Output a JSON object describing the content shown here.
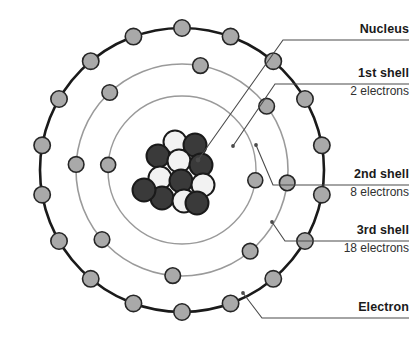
{
  "figure": {
    "background_color": "#ffffff"
  },
  "colors": {
    "outer_shell_stroke": "#1a1a1a",
    "inner_shell_stroke": "#9a9a9a",
    "electron_fill": "#a9a9a9",
    "electron_stroke": "#262626",
    "proton_fill": "#3a3a3a",
    "neutron_fill": "#f2f2f2",
    "nucleon_stroke": "#1a1a1a",
    "leader_line": "#4a4a4a",
    "label_text": "#1a1a1a",
    "sublabel_text": "#303030"
  },
  "labels": [
    {
      "id": "nucleus",
      "title": "Nucleus",
      "sub": "",
      "x": 318,
      "y": 22,
      "rule_y": 40,
      "rule_x1": 300,
      "rule_x2": 409
    },
    {
      "id": "shell-1",
      "title": "1st shell",
      "sub": "2 electrons",
      "x": 318,
      "y": 66,
      "rule_y": 84,
      "rule_x1": 292,
      "rule_x2": 409
    },
    {
      "id": "shell-2",
      "title": "2nd shell",
      "sub": "8 electrons",
      "x": 318,
      "y": 167,
      "rule_y": 185,
      "rule_x1": 292,
      "rule_x2": 409
    },
    {
      "id": "shell-3",
      "title": "3rd shell",
      "sub": "18 electrons",
      "x": 318,
      "y": 223,
      "rule_y": 241,
      "rule_x1": 300,
      "rule_x2": 409
    },
    {
      "id": "electron",
      "title": "Electron",
      "sub": "",
      "x": 318,
      "y": 300,
      "rule_y": 318,
      "rule_x1": 285,
      "rule_x2": 409
    }
  ],
  "leaders": [
    {
      "id": "leader-nucleus",
      "points": "300,40 283,40 198,160",
      "arrow_to": [
        198,
        160
      ],
      "has_arrow": true
    },
    {
      "id": "leader-shell-1",
      "points": "292,84 275,84 233,146",
      "arrow_to": [
        233,
        146
      ],
      "has_arrow": false
    },
    {
      "id": "leader-shell-2",
      "points": "292,185 273,185 256,145",
      "arrow_to": [
        256,
        145
      ],
      "has_arrow": false
    },
    {
      "id": "leader-shell-3",
      "points": "300,241 285,241 272,222",
      "arrow_to": [
        272,
        222
      ],
      "has_arrow": false
    },
    {
      "id": "leader-electron",
      "points": "285,318 262,318 243,293",
      "arrow_to": [
        243,
        293
      ],
      "has_arrow": false
    }
  ],
  "atom": {
    "center_x": 182,
    "center_y": 170,
    "nucleus_label": "nucleus",
    "shells": [
      {
        "id": "shell-1",
        "name": "1st shell",
        "radius": 74,
        "stroke": "#9a9a9a",
        "stroke_width": 1.4,
        "electron_count": 2,
        "electron_radius": 7.5,
        "electron_angles": [
          8,
          184
        ]
      },
      {
        "id": "shell-2",
        "name": "2nd shell",
        "radius": 106,
        "stroke": "#9a9a9a",
        "stroke_width": 1.6,
        "electron_count": 8,
        "electron_radius": 7.8,
        "electron_angles": [
          -80,
          -37,
          7,
          50,
          95,
          139,
          183,
          227
        ]
      },
      {
        "id": "shell-3",
        "name": "3rd shell",
        "radius": 142,
        "stroke": "#1a1a1a",
        "stroke_width": 2.6,
        "electron_count": 18,
        "electron_radius": 8.2,
        "electron_angles": [
          -90,
          -70,
          -50,
          -30,
          -10,
          10,
          30,
          50,
          70,
          90,
          110,
          130,
          150,
          170,
          190,
          210,
          230,
          250
        ]
      }
    ],
    "nucleus": {
      "particle_radius": 11.5,
      "particles": [
        {
          "type": "neutron",
          "dx": -7,
          "dy": -28
        },
        {
          "type": "proton",
          "dx": 13,
          "dy": -25
        },
        {
          "type": "proton",
          "dx": -24,
          "dy": -14
        },
        {
          "type": "neutron",
          "dx": -3,
          "dy": -9
        },
        {
          "type": "proton",
          "dx": 19,
          "dy": -5
        },
        {
          "type": "neutron",
          "dx": -22,
          "dy": 8
        },
        {
          "type": "proton",
          "dx": -1,
          "dy": 11
        },
        {
          "type": "neutron",
          "dx": 21,
          "dy": 15
        },
        {
          "type": "proton",
          "dx": -20,
          "dy": 28
        },
        {
          "type": "neutron",
          "dx": 2,
          "dy": 31
        },
        {
          "type": "proton",
          "dx": -38,
          "dy": 20
        },
        {
          "type": "proton",
          "dx": 15,
          "dy": 33
        }
      ]
    }
  }
}
